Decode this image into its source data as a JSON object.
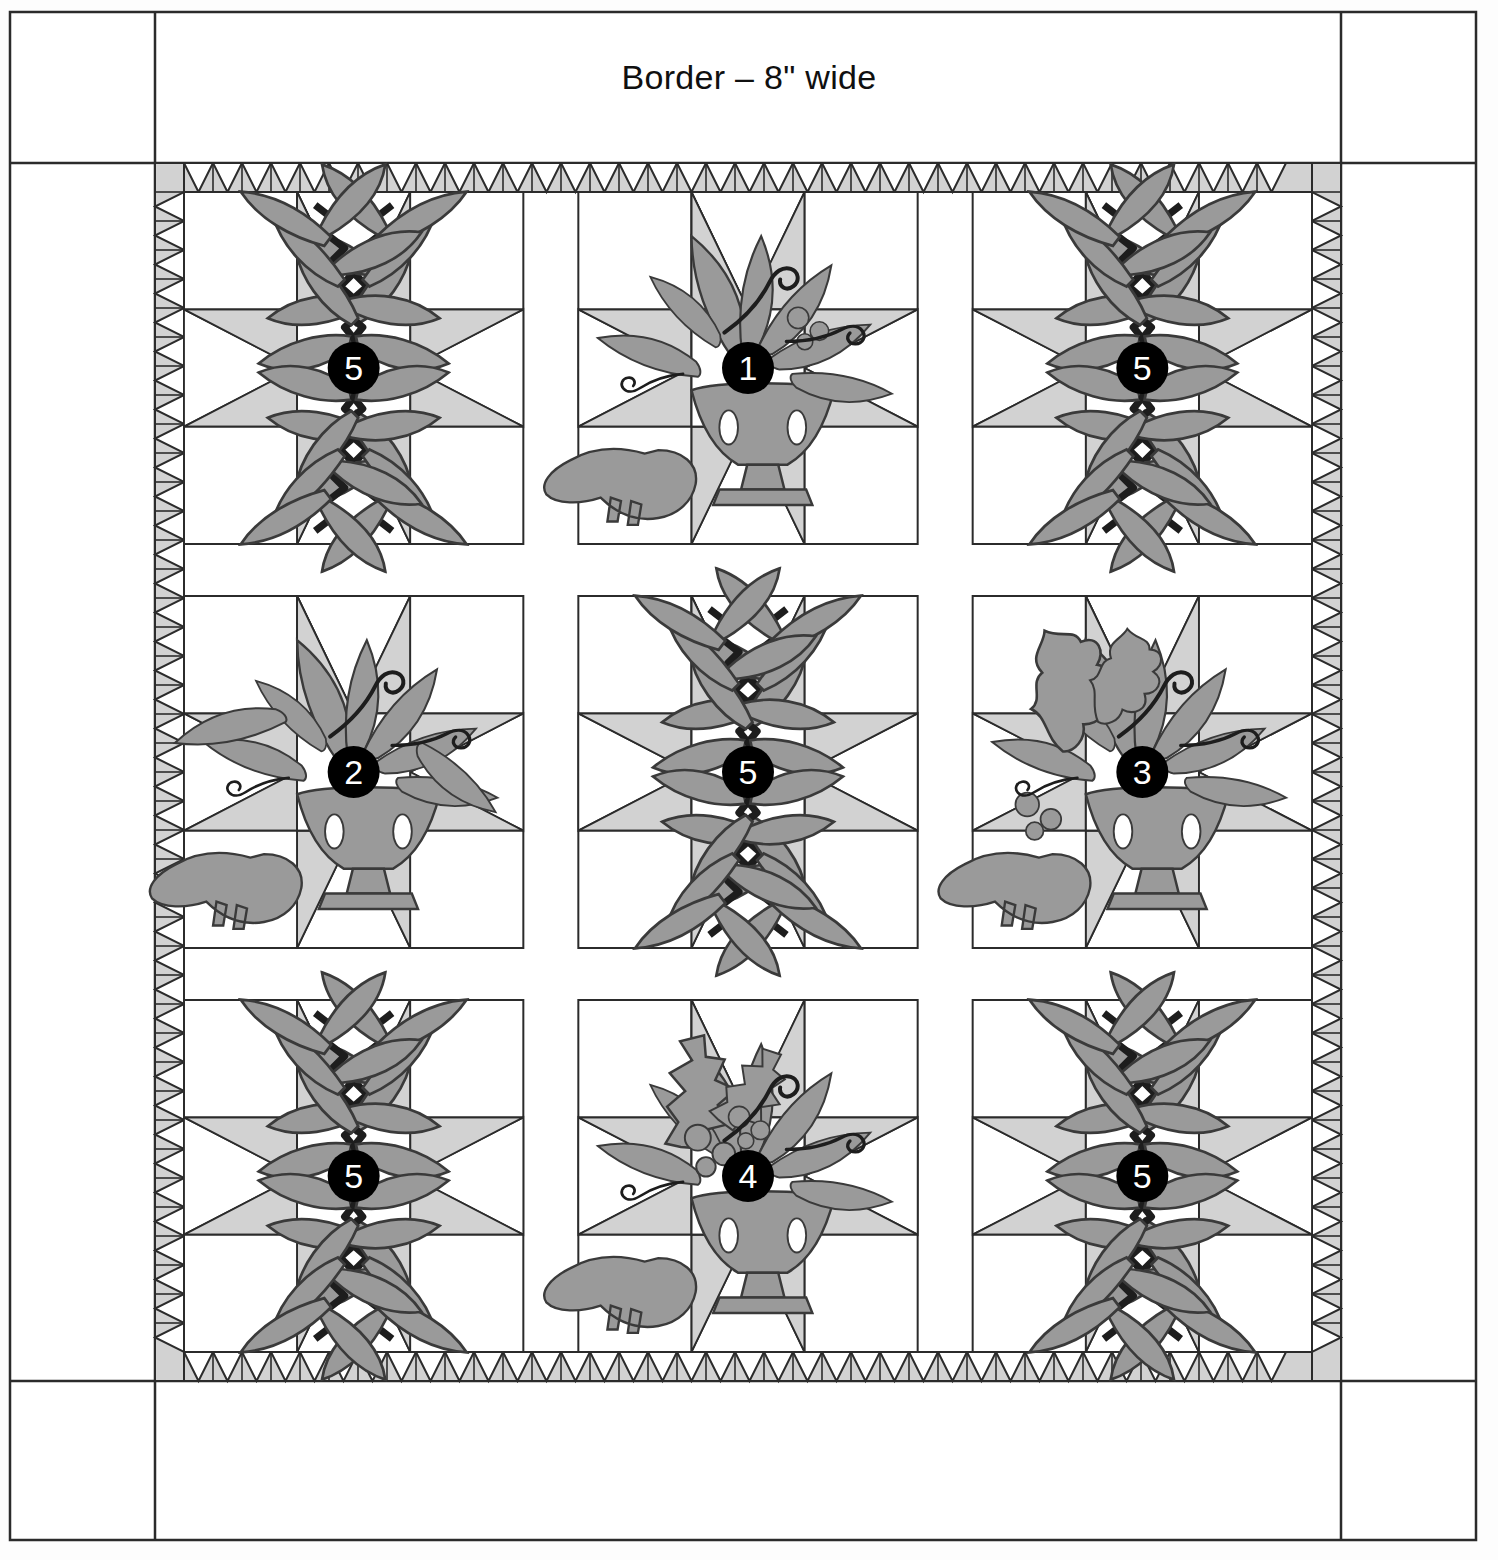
{
  "diagram": {
    "title": "Border – 8\" wide",
    "type": "quilt-layout-diagram",
    "canvas": {
      "width": 1498,
      "height": 1560
    }
  },
  "colors": {
    "background": "#ffffff",
    "outline": "#2b2b2b",
    "star_point_fill": "#d2d2d2",
    "sawtooth_fill": "#d2d2d2",
    "applique_fill": "#9a9a9a",
    "badge_fill": "#000000",
    "badge_text": "#ffffff",
    "block_background": "#ffffff"
  },
  "outer_border": {
    "label": "Border – 8\" wide",
    "width_inches": 8,
    "name": "outer-plain-border"
  },
  "sawtooth_border": {
    "name": "sawtooth-inner-border",
    "units_top": 40,
    "units_side": 40,
    "unit_size_px": 29,
    "triangle_direction": {
      "top": "down",
      "bottom": "down",
      "left": "left",
      "right": "right"
    }
  },
  "sashing": {
    "vertical_width_px": 55,
    "horizontal_height_px": 52,
    "color": "#ffffff"
  },
  "blocks": [
    {
      "row": 0,
      "col": 0,
      "number": "5",
      "motif": "leaf-wreath",
      "name": "block-r1c1"
    },
    {
      "row": 0,
      "col": 1,
      "number": "1",
      "motif": "urn-bird-foliage",
      "name": "block-r1c2"
    },
    {
      "row": 0,
      "col": 2,
      "number": "5",
      "motif": "leaf-wreath",
      "name": "block-r1c3"
    },
    {
      "row": 1,
      "col": 0,
      "number": "2",
      "motif": "urn-bird-scroll",
      "name": "block-r2c1"
    },
    {
      "row": 1,
      "col": 1,
      "number": "5",
      "motif": "leaf-wreath",
      "name": "block-r2c2"
    },
    {
      "row": 1,
      "col": 2,
      "number": "3",
      "motif": "oak-acorn-bird",
      "name": "block-r2c3"
    },
    {
      "row": 2,
      "col": 0,
      "number": "5",
      "motif": "leaf-wreath",
      "name": "block-r3c1"
    },
    {
      "row": 2,
      "col": 1,
      "number": "4",
      "motif": "holly-berry-bird",
      "name": "block-r3c2"
    },
    {
      "row": 2,
      "col": 2,
      "number": "5",
      "motif": "leaf-wreath",
      "name": "block-r3c3"
    }
  ],
  "legend_numbers": [
    "1",
    "2",
    "3",
    "4",
    "5"
  ]
}
